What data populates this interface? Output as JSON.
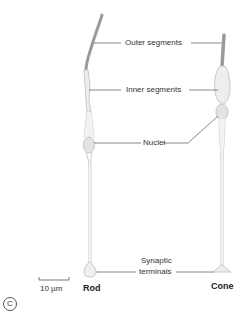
{
  "figure": {
    "panel_label": "C",
    "scale_bar": {
      "label": "10 µm"
    },
    "cells": [
      {
        "name": "Rod"
      },
      {
        "name": "Cone"
      }
    ],
    "labels": {
      "outer_segments": "Outer segments",
      "inner_segments": "Inner segments",
      "nuclei": "Nuclei",
      "synaptic_terminals_line1": "Synaptic",
      "synaptic_terminals_line2": "terminals"
    },
    "colors": {
      "outer_segment": "#9a9a9a",
      "cell_body_fill": "#eeeeee",
      "cell_outline": "#bdbdbd",
      "leader_line": "#555555"
    }
  }
}
